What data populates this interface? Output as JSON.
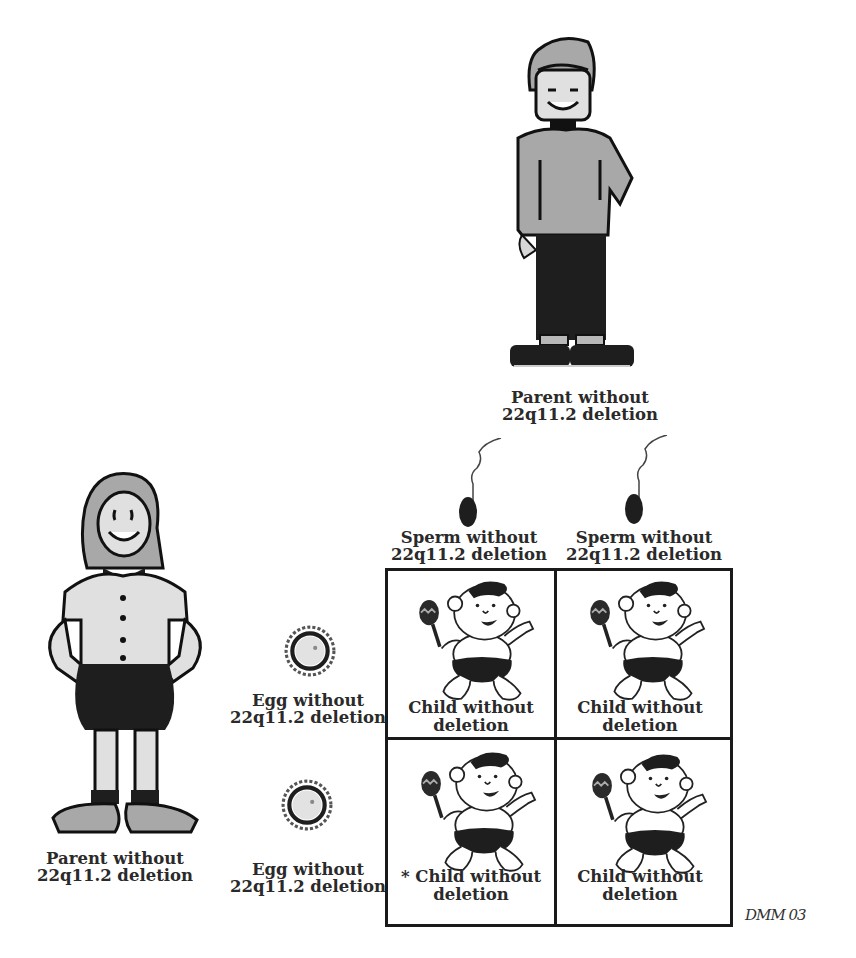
{
  "diagram": {
    "type": "punnett-square-inheritance",
    "father": {
      "label_line1": "Parent without",
      "label_line2": "22q11.2 deletion",
      "icon": "cartoon-boy"
    },
    "mother": {
      "label_line1": "Parent without",
      "label_line2": "22q11.2 deletion",
      "icon": "cartoon-girl"
    },
    "sperm": [
      {
        "label_line1": "Sperm without",
        "label_line2": "22q11.2 deletion",
        "icon": "sperm-cell"
      },
      {
        "label_line1": "Sperm without",
        "label_line2": "22q11.2 deletion",
        "icon": "sperm-cell"
      }
    ],
    "eggs": [
      {
        "label_line1": "Egg without",
        "label_line2": "22q11.2 deletion",
        "icon": "egg-cell"
      },
      {
        "label_line1": "Egg without",
        "label_line2": "22q11.2 deletion",
        "icon": "egg-cell"
      }
    ],
    "children": [
      {
        "label_line1": "Child without",
        "label_line2": "deletion",
        "icon": "cartoon-baby"
      },
      {
        "label_line1": "Child without",
        "label_line2": "deletion",
        "icon": "cartoon-baby"
      },
      {
        "label_line1": "* Child without",
        "label_line2": "deletion",
        "icon": "cartoon-baby"
      },
      {
        "label_line1": "Child without",
        "label_line2": "deletion",
        "icon": "cartoon-baby"
      }
    ],
    "signature": "DMM 03"
  },
  "colors": {
    "ink": "#1a1a1a",
    "shirt_gray": "#a8a8a8",
    "light_gray": "#d8d8d8",
    "background": "#ffffff"
  }
}
